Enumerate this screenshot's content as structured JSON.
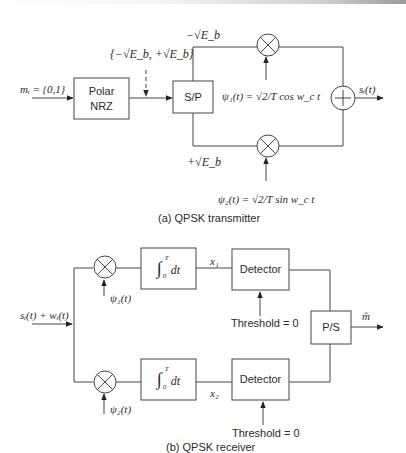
{
  "transmitter": {
    "caption": "(a) QPSK transmitter",
    "input_label": "mᵢ = {0,1}",
    "polar_nrz": {
      "line1": "Polar",
      "line2": "NRZ"
    },
    "levels_label": "{−√E_b, +√E_b}",
    "sp_block": "S/P",
    "upper_branch_level": "−√E_b",
    "lower_branch_level": "+√E_b",
    "psi1": "ψ₁(t) = √2/T cos w_c t",
    "psi2": "ψ₂(t) = √2/T sin w_c t",
    "output_label": "sᵢ(t)",
    "mixer_symbol": "⊗",
    "adder_symbol": "+"
  },
  "receiver": {
    "caption": "(b) QPSK receiver",
    "input_label": "sᵢ(t) + wᵢ(t)",
    "psi1": "ψ₁(t)",
    "psi2": "ψ₂(t)",
    "integrator": "∫₀ᵀ dt",
    "integrator_upper_limit": "T",
    "integrator_lower_limit": "0",
    "integrator_body": "dt",
    "x1": "x₁",
    "x2": "x₂",
    "detector": "Detector",
    "threshold": "Threshold = 0",
    "ps_block": "P/S",
    "output_label": "m̂"
  }
}
